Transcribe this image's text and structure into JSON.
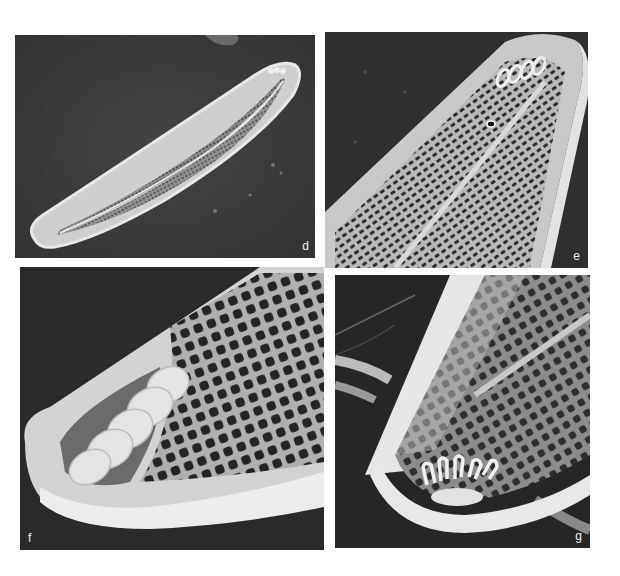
{
  "figure": {
    "panels": [
      {
        "id": "d",
        "label": "d",
        "content": "whole valve, external view, curved lanceolate outline with central raphe and striae"
      },
      {
        "id": "e",
        "label": "e",
        "content": "valve apex, internal view, showing areolae rows and helical end structure"
      },
      {
        "id": "f",
        "label": "f",
        "content": "valve apex enlarged, oblique view, coiled structure and areolae"
      },
      {
        "id": "g",
        "label": "g",
        "content": "valve apex, internal oblique view with comb-like rimoportula-type structures"
      }
    ]
  },
  "colors": {
    "background": "#ffffff",
    "panel_background": "#2e2e2e",
    "valve_light": "#d8d8d8",
    "valve_mid": "#9a9a9a",
    "label_color": "#f2f2f2"
  }
}
